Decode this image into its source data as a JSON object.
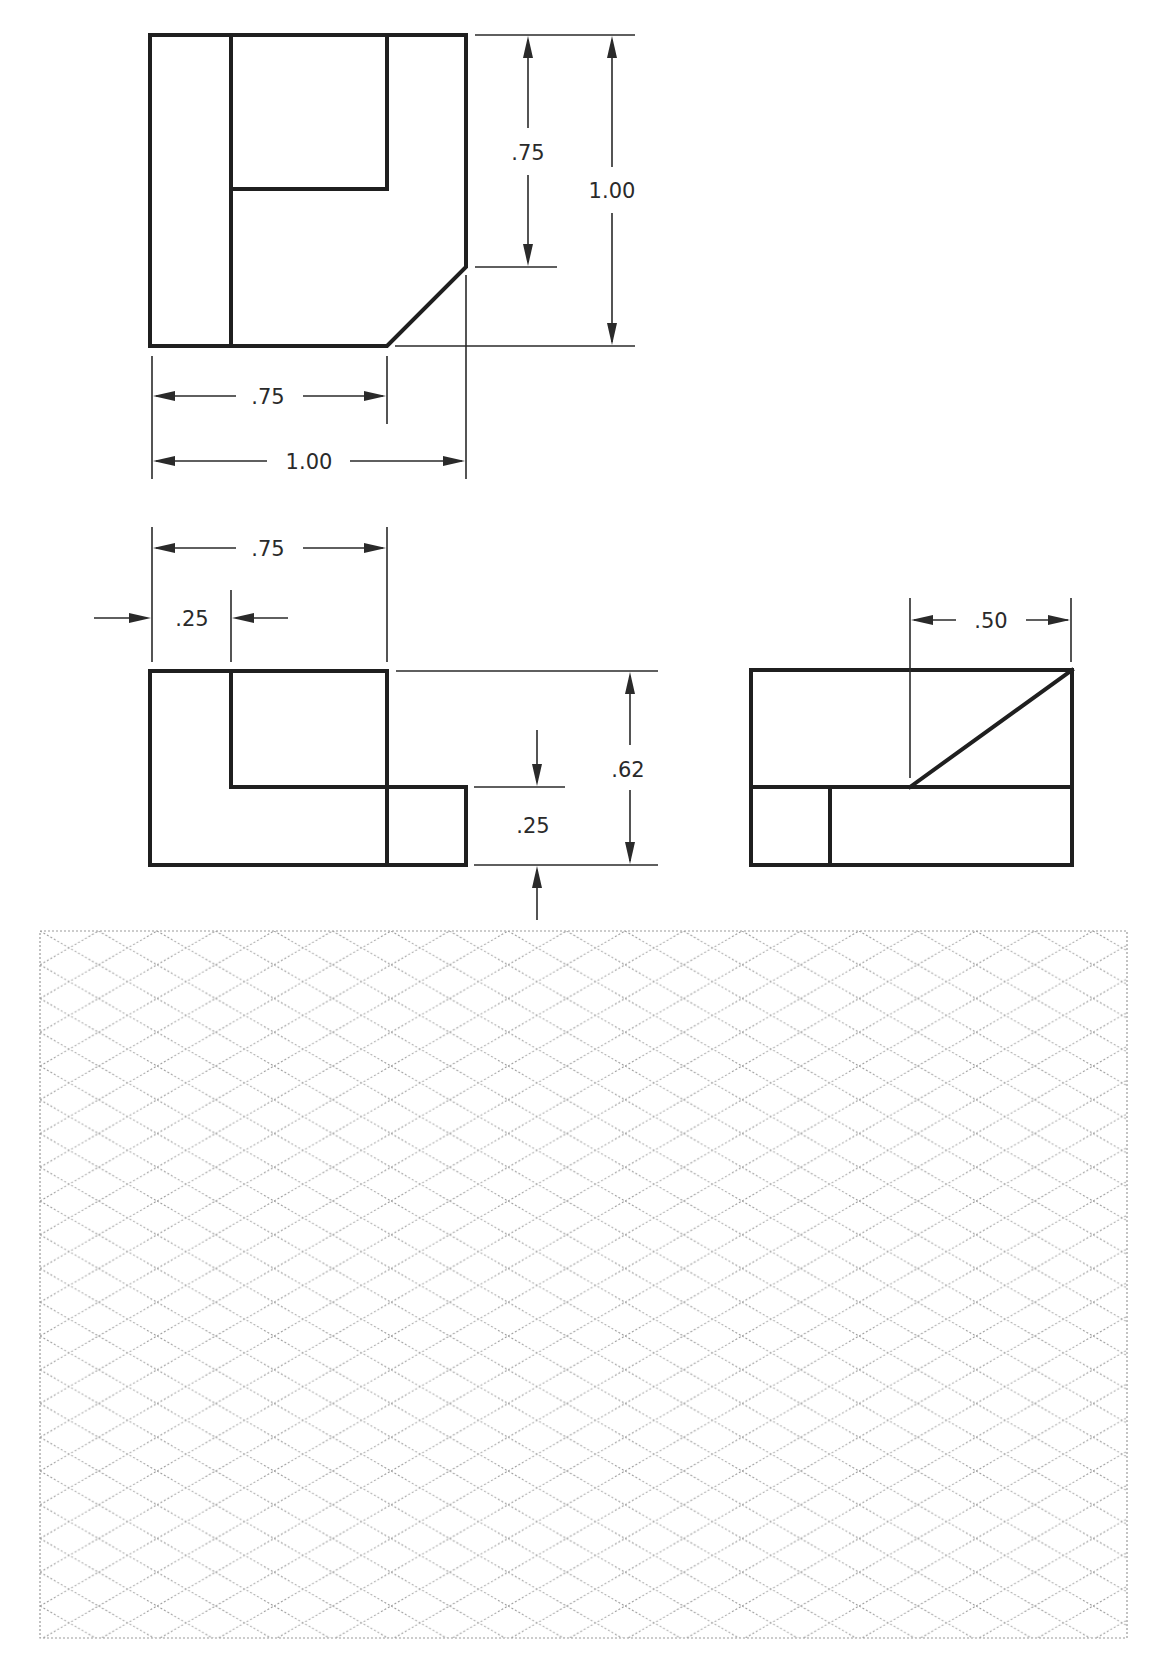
{
  "drawing": {
    "type": "orthographic-projection-exercise",
    "views": {
      "top": {
        "dimensions": {
          "chamfer_depth": ".75",
          "overall_depth": "1.00",
          "step_width": ".75",
          "overall_width": "1.00"
        }
      },
      "front": {
        "dimensions": {
          "upper_width": ".75",
          "inset": ".25",
          "step_height": ".25",
          "overall_height": ".62"
        }
      },
      "right_side": {
        "dimensions": {
          "slope_width": ".50"
        }
      }
    },
    "sketch_area": {
      "kind": "isometric-grid",
      "label": ""
    }
  },
  "colors": {
    "line": "#1f1f1f",
    "dimension": "#2a2a2a",
    "grid": "#9a9a9a",
    "background": "#ffffff"
  }
}
